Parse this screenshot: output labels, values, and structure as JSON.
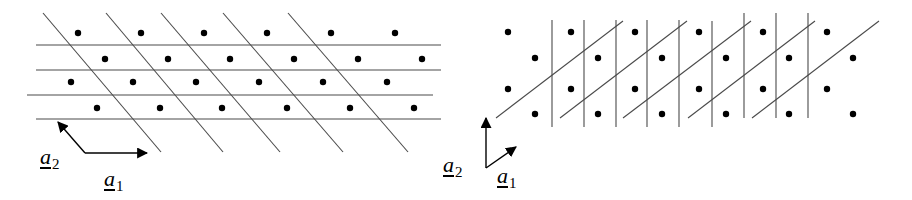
{
  "figure": {
    "left_panel": {
      "description": "2D lattice with rows parallel to a1 and oblique planes",
      "dots": [
        [
          78,
          33
        ],
        [
          141,
          33
        ],
        [
          204,
          33
        ],
        [
          267,
          33
        ],
        [
          331,
          33
        ],
        [
          395,
          33
        ],
        [
          105,
          59
        ],
        [
          168,
          59
        ],
        [
          230,
          59
        ],
        [
          294,
          59
        ],
        [
          358,
          59
        ],
        [
          422,
          59
        ],
        [
          71,
          82
        ],
        [
          133,
          82
        ],
        [
          196,
          82
        ],
        [
          259,
          82
        ],
        [
          323,
          82
        ],
        [
          387,
          82
        ],
        [
          97,
          108
        ],
        [
          160,
          108
        ],
        [
          222,
          108
        ],
        [
          287,
          108
        ],
        [
          350,
          108
        ],
        [
          414,
          108
        ]
      ],
      "horizontal_lines": [
        {
          "x1": 36,
          "y1": 45,
          "x2": 441,
          "y2": 45
        },
        {
          "x1": 36,
          "y1": 70,
          "x2": 441,
          "y2": 70
        },
        {
          "x1": 27,
          "y1": 95,
          "x2": 433,
          "y2": 95
        },
        {
          "x1": 36,
          "y1": 119,
          "x2": 441,
          "y2": 119
        }
      ],
      "oblique_lines": [
        {
          "x1": 43,
          "y1": 13,
          "x2": 161,
          "y2": 152
        },
        {
          "x1": 106,
          "y1": 13,
          "x2": 223,
          "y2": 152
        },
        {
          "x1": 161,
          "y1": 13,
          "x2": 280,
          "y2": 152
        },
        {
          "x1": 223,
          "y1": 13,
          "x2": 343,
          "y2": 152
        },
        {
          "x1": 288,
          "y1": 13,
          "x2": 408,
          "y2": 152
        }
      ],
      "vectors": {
        "origin": [
          85,
          153
        ],
        "a1": {
          "to": [
            147,
            153
          ],
          "label_base": "a",
          "label_sub": "1",
          "label_pos": [
            104,
            168
          ]
        },
        "a2": {
          "to": [
            58,
            122
          ],
          "label_base": "a",
          "label_sub": "2",
          "label_pos": [
            40,
            146
          ]
        }
      }
    },
    "right_panel": {
      "description": "Same lattice with vertical planes and oblique planes",
      "dots": [
        [
          508,
          32
        ],
        [
          571,
          32
        ],
        [
          635,
          32
        ],
        [
          699,
          32
        ],
        [
          763,
          32
        ],
        [
          827,
          32
        ],
        [
          535,
          58
        ],
        [
          598,
          58
        ],
        [
          662,
          58
        ],
        [
          726,
          58
        ],
        [
          789,
          58
        ],
        [
          853,
          58
        ],
        [
          508,
          89
        ],
        [
          571,
          89
        ],
        [
          635,
          89
        ],
        [
          699,
          89
        ],
        [
          763,
          89
        ],
        [
          827,
          89
        ],
        [
          535,
          114
        ],
        [
          598,
          114
        ],
        [
          662,
          114
        ],
        [
          726,
          114
        ],
        [
          789,
          114
        ],
        [
          853,
          114
        ]
      ],
      "vertical_lines": [
        {
          "x": 552,
          "y1": 20,
          "y2": 127
        },
        {
          "x": 584,
          "y1": 20,
          "y2": 127
        },
        {
          "x": 616,
          "y1": 20,
          "y2": 127
        },
        {
          "x": 647,
          "y1": 20,
          "y2": 127
        },
        {
          "x": 679,
          "y1": 20,
          "y2": 127
        },
        {
          "x": 712,
          "y1": 21,
          "y2": 127
        },
        {
          "x": 744,
          "y1": 13,
          "y2": 118
        },
        {
          "x": 776,
          "y1": 13,
          "y2": 118
        },
        {
          "x": 808,
          "y1": 13,
          "y2": 118
        }
      ],
      "oblique_lines": [
        {
          "x1": 496,
          "y1": 118,
          "x2": 623,
          "y2": 21
        },
        {
          "x1": 560,
          "y1": 118,
          "x2": 687,
          "y2": 21
        },
        {
          "x1": 623,
          "y1": 118,
          "x2": 751,
          "y2": 21
        },
        {
          "x1": 688,
          "y1": 118,
          "x2": 815,
          "y2": 21
        },
        {
          "x1": 752,
          "y1": 118,
          "x2": 879,
          "y2": 21
        }
      ],
      "vectors": {
        "origin": [
          486,
          168
        ],
        "a1": {
          "to": [
            516,
            147
          ],
          "label_base": "a",
          "label_sub": "1",
          "label_pos": [
            497,
            165
          ]
        },
        "a2": {
          "to": [
            486,
            118
          ],
          "label_base": "a",
          "label_sub": "2",
          "label_pos": [
            443,
            154
          ]
        }
      }
    }
  }
}
